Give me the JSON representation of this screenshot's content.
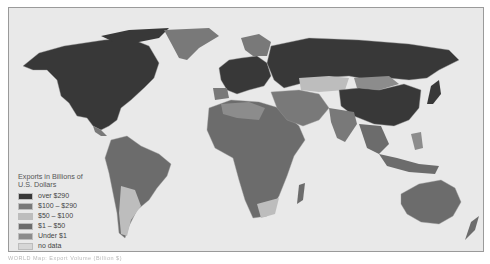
{
  "map": {
    "title": "World Exports Map",
    "legend": {
      "title": "Exports in Billions of U.S. Dollars",
      "items": [
        {
          "label": "over $290",
          "color": "#383838"
        },
        {
          "label": "$100 – $290",
          "color": "#797979"
        },
        {
          "label": "$50 – $100",
          "color": "#bdbdbd"
        },
        {
          "label": "$1 – $50",
          "color": "#6c6c6c"
        },
        {
          "label": "Under $1",
          "color": "#8c8c8c"
        },
        {
          "label": "no data",
          "color": "#d6d6d6"
        }
      ]
    },
    "colors": {
      "ocean": "#e9e9e9",
      "over_290": "#383838",
      "range_100_290": "#797979",
      "range_50_100": "#bdbdbd",
      "range_1_50": "#6c6c6c",
      "under_1": "#8c8c8c",
      "no_data": "#d6d6d6"
    },
    "caption": "WORLD Map: Export Volume (Billion $)"
  }
}
